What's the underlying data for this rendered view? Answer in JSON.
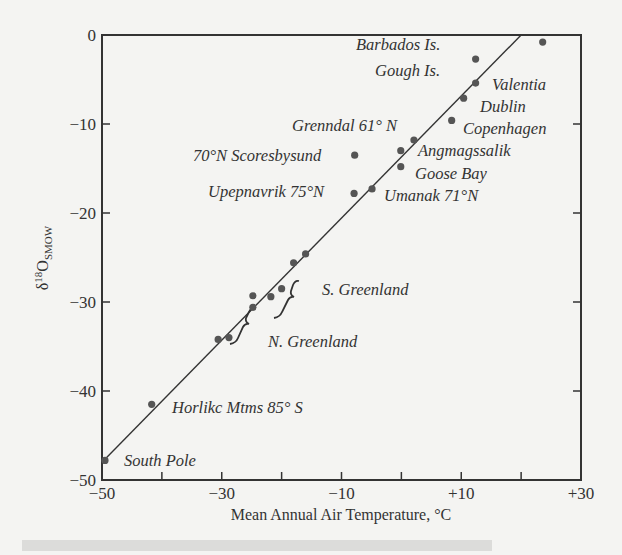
{
  "chart_data": {
    "type": "scatter",
    "title": "",
    "xlabel": "Mean Annual Air Temperature, °C",
    "ylabel": "δ18O SMOW",
    "ylabel_parts": {
      "delta": "δ",
      "sup": "18",
      "o": "O",
      "sub": "SMOW"
    },
    "xlim": [
      -50,
      30
    ],
    "ylim": [
      -50,
      0
    ],
    "x_ticks": [
      -50,
      -40,
      -30,
      -20,
      -10,
      0,
      10,
      20,
      30
    ],
    "x_tick_labels": {
      "-50": "−50",
      "-30": "−30",
      "-10": "−10",
      "10": "+10",
      "30": "+30"
    },
    "y_ticks": [
      0,
      -10,
      -20,
      -30,
      -40,
      -50
    ],
    "y_tick_labels": [
      "0",
      "−10",
      "−20",
      "−30",
      "−40",
      "−50"
    ],
    "grid": false,
    "legend": null,
    "fit_line": {
      "x": [
        -50,
        20
      ],
      "y": [
        -48,
        0
      ]
    },
    "points": [
      {
        "label": "",
        "x": 23.6,
        "y": -0.8
      },
      {
        "label": "Barbados Is.",
        "x": 12.4,
        "y": -2.7
      },
      {
        "label": "Gough Is. / Valentia",
        "x": 12.4,
        "y": -5.4
      },
      {
        "label": "Dublin",
        "x": 10.4,
        "y": -7.1
      },
      {
        "label": "Copenhagen",
        "x": 8.4,
        "y": -9.6
      },
      {
        "label": "Grenndal 61° N",
        "x": 2.1,
        "y": -11.8
      },
      {
        "label": "Angmagssalik",
        "x": -0.1,
        "y": -13.0
      },
      {
        "label": "Goose Bay",
        "x": -0.1,
        "y": -14.8
      },
      {
        "label": "70°N Scoresbysund",
        "x": -7.8,
        "y": -13.5
      },
      {
        "label": "Upepnavrik 75°N",
        "x": -7.9,
        "y": -17.8
      },
      {
        "label": "Umanak 71°N",
        "x": -4.9,
        "y": -17.3
      },
      {
        "label": "S. Greenland",
        "x": -16.0,
        "y": -24.6
      },
      {
        "label": "S. Greenland",
        "x": -18.0,
        "y": -25.6
      },
      {
        "label": "S. Greenland",
        "x": -20.0,
        "y": -28.5
      },
      {
        "label": "S. Greenland",
        "x": -21.8,
        "y": -29.4
      },
      {
        "label": "N. Greenland",
        "x": -24.8,
        "y": -29.3
      },
      {
        "label": "N. Greenland",
        "x": -24.8,
        "y": -30.6
      },
      {
        "label": "N. Greenland",
        "x": -28.8,
        "y": -34.0
      },
      {
        "label": "N. Greenland",
        "x": -30.6,
        "y": -34.2
      },
      {
        "label": "Horlikc Mtms 85° S",
        "x": -41.7,
        "y": -41.5
      },
      {
        "label": "South Pole",
        "x": -49.5,
        "y": -47.8
      }
    ],
    "annotations": [
      {
        "text": "Barbados Is.",
        "x": 356,
        "y": 50
      },
      {
        "text": "Gough Is.",
        "x": 375,
        "y": 76
      },
      {
        "text": "Valentia",
        "x": 492,
        "y": 90
      },
      {
        "text": "Dublin",
        "x": 480,
        "y": 112
      },
      {
        "text": "Grenndal 61° N",
        "x": 292,
        "y": 131
      },
      {
        "text": "Copenhagen",
        "x": 463,
        "y": 134
      },
      {
        "text": "70°N Scoresbysund",
        "x": 193,
        "y": 161
      },
      {
        "text": "Angmagssalik",
        "x": 418,
        "y": 156
      },
      {
        "text": "Goose Bay",
        "x": 415,
        "y": 179
      },
      {
        "text": "Upepnavrik 75°N",
        "x": 208,
        "y": 197
      },
      {
        "text": "Umanak 71°N",
        "x": 384,
        "y": 201
      },
      {
        "text": "S. Greenland",
        "x": 322,
        "y": 295
      },
      {
        "text": "N. Greenland",
        "x": 268,
        "y": 347
      },
      {
        "text": "Horlikc Mtms 85° S",
        "x": 172,
        "y": 413
      },
      {
        "text": "South Pole",
        "x": 124,
        "y": 466
      }
    ]
  }
}
